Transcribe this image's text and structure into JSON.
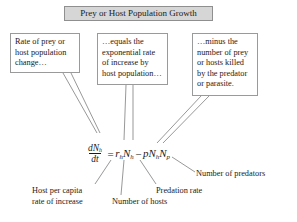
{
  "figure": {
    "title": "Prey or Host Population Growth",
    "background_color": "#ffffff",
    "title_box_fill": "#d6d6d6",
    "box_border_color": "#9a9a9a",
    "text_color": "#1a1a1a"
  },
  "callouts": [
    {
      "id": "rate-of-change",
      "text": "Rate of prey or host population change…"
    },
    {
      "id": "equals-exponential",
      "text": "…equals the exponential rate of increase by host population…"
    },
    {
      "id": "minus-killed",
      "text": "…minus the number of prey or hosts killed by the predator or parasite."
    }
  ],
  "equation": {
    "plain": "dNh/dt = rh Nh - p Nh Np",
    "numerator": "dN",
    "numerator_sub": "h",
    "denominator": "dt",
    "equals": "=",
    "term1_var": "r",
    "term1_sub": "h",
    "term1_var2": "N",
    "term1_sub2": "h",
    "minus": "−",
    "term2_var": "p",
    "term2_var2": "N",
    "term2_sub2": "h",
    "term2_var3": "N",
    "term2_sub3": "p"
  },
  "leader_labels": [
    {
      "id": "host-per-capita",
      "line1": "Host per capita",
      "line2": "rate of increase"
    },
    {
      "id": "number-of-hosts",
      "text": "Number of hosts"
    },
    {
      "id": "predation-rate",
      "text": "Predation rate"
    },
    {
      "id": "number-of-predators",
      "text": "Number of predators"
    }
  ]
}
